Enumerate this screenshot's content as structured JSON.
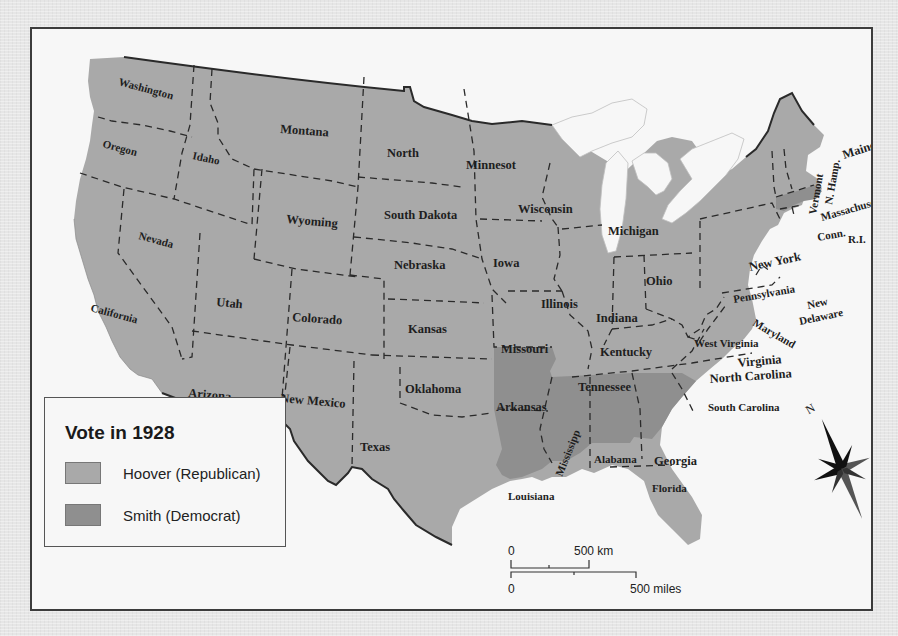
{
  "map": {
    "title": "Vote in 1928",
    "colors": {
      "republican": "#a9a9a9",
      "democrat": "#8f8f8f",
      "water": "#f7f7f7",
      "border": "#2a2a2a",
      "page_background": "#e6e6e6"
    },
    "legend": {
      "title": "Vote in 1928",
      "items": [
        {
          "label": "Hoover (Republican)",
          "color": "#a9a9a9"
        },
        {
          "label": "Smith (Democrat)",
          "color": "#8f8f8f"
        }
      ]
    },
    "states": [
      {
        "label": "Washington",
        "party": "Hoover (Republican)"
      },
      {
        "label": "Oregon",
        "party": "Hoover (Republican)"
      },
      {
        "label": "California",
        "party": "Hoover (Republican)"
      },
      {
        "label": "Nevada",
        "party": "Hoover (Republican)"
      },
      {
        "label": "Idaho",
        "party": "Hoover (Republican)"
      },
      {
        "label": "Montana",
        "party": "Hoover (Republican)"
      },
      {
        "label": "Wyoming",
        "party": "Hoover (Republican)"
      },
      {
        "label": "Utah",
        "party": "Hoover (Republican)"
      },
      {
        "label": "Colorado",
        "party": "Hoover (Republican)"
      },
      {
        "label": "Arizona",
        "party": "Hoover (Republican)"
      },
      {
        "label": "New Mexico",
        "party": "Hoover (Republican)"
      },
      {
        "label": "North",
        "party": "Hoover (Republican)"
      },
      {
        "label": "South Dakota",
        "party": "Hoover (Republican)"
      },
      {
        "label": "Nebraska",
        "party": "Hoover (Republican)"
      },
      {
        "label": "Kansas",
        "party": "Hoover (Republican)"
      },
      {
        "label": "Oklahoma",
        "party": "Hoover (Republican)"
      },
      {
        "label": "Texas",
        "party": "Hoover (Republican)"
      },
      {
        "label": "Minnesot",
        "party": "Hoover (Republican)"
      },
      {
        "label": "Iowa",
        "party": "Hoover (Republican)"
      },
      {
        "label": "Missouri",
        "party": "Hoover (Republican)"
      },
      {
        "label": "Arkansas",
        "party": "Smith (Democrat)"
      },
      {
        "label": "Louisiana",
        "party": "Smith (Democrat)"
      },
      {
        "label": "Wisconsin",
        "party": "Hoover (Republican)"
      },
      {
        "label": "Illinois",
        "party": "Hoover (Republican)"
      },
      {
        "label": "Michigan",
        "party": "Hoover (Republican)"
      },
      {
        "label": "Indiana",
        "party": "Hoover (Republican)"
      },
      {
        "label": "Ohio",
        "party": "Hoover (Republican)"
      },
      {
        "label": "Kentucky",
        "party": "Hoover (Republican)"
      },
      {
        "label": "Tennessee",
        "party": "Hoover (Republican)"
      },
      {
        "label": "Mississipp",
        "party": "Smith (Democrat)"
      },
      {
        "label": "Alabama",
        "party": "Smith (Democrat)"
      },
      {
        "label": "Georgia",
        "party": "Smith (Democrat)"
      },
      {
        "label": "Florida",
        "party": "Hoover (Republican)"
      },
      {
        "label": "South Carolina",
        "party": "Smith (Democrat)"
      },
      {
        "label": "North Carolina",
        "party": "Hoover (Republican)"
      },
      {
        "label": "Virginia",
        "party": "Hoover (Republican)"
      },
      {
        "label": "West Virginia",
        "party": "Hoover (Republican)"
      },
      {
        "label": "Maryland",
        "party": "Hoover (Republican)"
      },
      {
        "label": "Delaware",
        "party": "Hoover (Republican)"
      },
      {
        "label": "New",
        "party": "Hoover (Republican)"
      },
      {
        "label": "Pennsylvania",
        "party": "Hoover (Republican)"
      },
      {
        "label": "New York",
        "party": "Hoover (Republican)"
      },
      {
        "label": "Vermont",
        "party": "Hoover (Republican)"
      },
      {
        "label": "N. Hamp.",
        "party": "Hoover (Republican)"
      },
      {
        "label": "Maine",
        "party": "Hoover (Republican)"
      },
      {
        "label": "Massachusetts",
        "party": "Smith (Democrat)"
      },
      {
        "label": "Conn.",
        "party": "Hoover (Republican)"
      },
      {
        "label": "R.I.",
        "party": "Smith (Democrat)"
      }
    ],
    "scale": {
      "km_zero": "0",
      "km_label": "500 km",
      "mi_zero": "0",
      "mi_label": "500 miles"
    },
    "compass": {
      "north_label": "N",
      "icon": "compass-rose-icon"
    }
  }
}
